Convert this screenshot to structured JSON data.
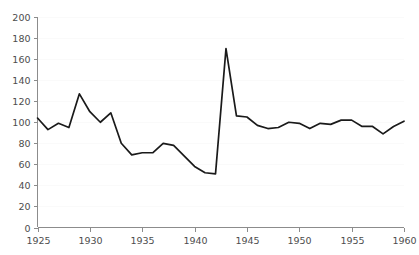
{
  "chart_data": {
    "type": "line",
    "title": "",
    "subtitle": "",
    "xlabel": "",
    "ylabel": "",
    "xlim": [
      1925,
      1960
    ],
    "ylim": [
      0,
      200
    ],
    "grid": true,
    "grid_axis": "y",
    "legend": false,
    "legend_position": "none",
    "line_color": "#1a1a1a",
    "axis_color": "#8c8c8c",
    "grid_color": "#fafafa",
    "background_color": "#ffffff",
    "x_ticks": [
      1925,
      1930,
      1935,
      1940,
      1945,
      1950,
      1955,
      1960
    ],
    "x_tick_labels": [
      "1925",
      "1930",
      "1935",
      "1940",
      "1945",
      "1950",
      "1955",
      "1960"
    ],
    "y_ticks": [
      0,
      20,
      40,
      60,
      80,
      100,
      120,
      140,
      160,
      180,
      200
    ],
    "y_tick_labels": [
      "0",
      "20",
      "40",
      "60",
      "80",
      "100",
      "120",
      "140",
      "160",
      "180",
      "200"
    ],
    "x": [
      1925,
      1926,
      1927,
      1928,
      1929,
      1930,
      1931,
      1932,
      1933,
      1934,
      1935,
      1936,
      1937,
      1938,
      1939,
      1940,
      1941,
      1942,
      1943,
      1944,
      1945,
      1946,
      1947,
      1948,
      1949,
      1950,
      1951,
      1952,
      1953,
      1954,
      1955,
      1956,
      1957,
      1958,
      1959,
      1960
    ],
    "series": [
      {
        "name": "series-1",
        "color": "#1a1a1a",
        "values": [
          104,
          93,
          99,
          95,
          127,
          110,
          100,
          109,
          80,
          69,
          71,
          71,
          80,
          78,
          68,
          58,
          52,
          51,
          170,
          106,
          105,
          97,
          94,
          95,
          100,
          99,
          94,
          99,
          98,
          102,
          102,
          96,
          96,
          89,
          96,
          101
        ]
      }
    ]
  }
}
